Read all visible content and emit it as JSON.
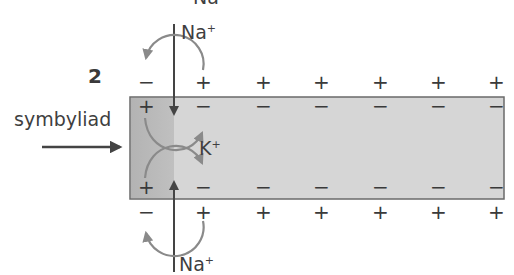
{
  "diagram": {
    "step_number": "2",
    "stimulus_label": "symbyliad",
    "ions": {
      "top_partial": "Na",
      "top_influx": "Na",
      "top_influx_charge": "+",
      "bottom_influx": "Na",
      "bottom_influx_charge": "+",
      "local_current": "K",
      "local_current_charge": "+"
    },
    "membrane": {
      "outer_top_charges": [
        "−",
        "+",
        "+",
        "+",
        "+",
        "+",
        "+",
        "+"
      ],
      "inner_top_charges": [
        "+",
        "−",
        "−",
        "−",
        "−",
        "−",
        "−",
        "−"
      ],
      "inner_bottom_charges": [
        "+",
        "−",
        "−",
        "−",
        "−",
        "−",
        "−",
        "−"
      ],
      "outer_bottom_charges": [
        "−",
        "+",
        "+",
        "+",
        "+",
        "+",
        "+",
        "+"
      ]
    },
    "colors": {
      "axon_fill": "#d6d6d6",
      "depolarized_fill": "#b9b9b9",
      "axon_border": "#6a6a6a",
      "arrow_dark": "#444444",
      "arrow_curved": "#8a8a8a",
      "text": "#3a3a3a"
    }
  }
}
